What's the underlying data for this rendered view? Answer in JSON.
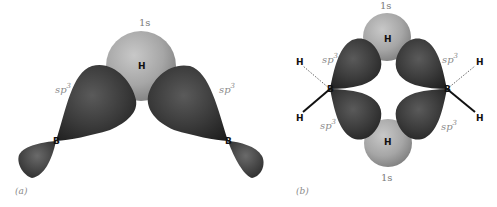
{
  "figure": {
    "panel_a": {
      "label": "(a)",
      "s_orbital_label": "1s",
      "bridging_atom": "H",
      "left_hybrid_label": "sp",
      "right_hybrid_label": "sp",
      "hybrid_superscript": "3",
      "boron_left": "B",
      "boron_right": "B"
    },
    "panel_b": {
      "label": "(b)",
      "top_s_label": "1s",
      "bottom_s_label": "1s",
      "top_bridging_atom": "H",
      "bottom_bridging_atom": "H",
      "hybrid_label": "sp",
      "hybrid_superscript": "3",
      "terminal_h_top_left": "H",
      "terminal_h_bottom_left": "H",
      "terminal_h_top_right": "H",
      "terminal_h_bottom_right": "H",
      "boron_left": "B",
      "boron_right": "B"
    },
    "colors": {
      "hybrid_lobe": "#3a3a3a",
      "s_orbital": "#a8a8a8",
      "label_gray": "#8a8a8a"
    }
  }
}
